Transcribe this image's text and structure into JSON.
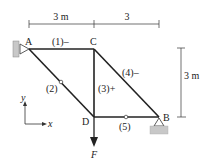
{
  "diagram": {
    "type": "truss",
    "dimensions": {
      "top_left": "3 m",
      "top_right": "3",
      "right_vertical": "3 m"
    },
    "nodes": {
      "A": "A",
      "B": "B",
      "C": "C",
      "D": "D"
    },
    "members": [
      {
        "id": "1",
        "label": "(1)–",
        "from": "A",
        "to": "C",
        "sign": "-"
      },
      {
        "id": "2",
        "label": "(2)",
        "from": "A",
        "to": "D",
        "sign": ""
      },
      {
        "id": "3",
        "label": "(3)+",
        "from": "C",
        "to": "D",
        "sign": "+"
      },
      {
        "id": "4",
        "label": "(4)–",
        "from": "C",
        "to": "B",
        "sign": "-"
      },
      {
        "id": "5",
        "label": "(5)",
        "from": "D",
        "to": "B",
        "sign": ""
      }
    ],
    "load": {
      "label": "F",
      "node": "D",
      "direction": "down"
    },
    "axes": {
      "x": "x",
      "y": "y"
    },
    "supports": [
      {
        "node": "A",
        "type": "pin-wall"
      },
      {
        "node": "B",
        "type": "pin-ground"
      }
    ],
    "colors": {
      "line": "#222222",
      "support_fill": "#c8c8c8"
    }
  }
}
